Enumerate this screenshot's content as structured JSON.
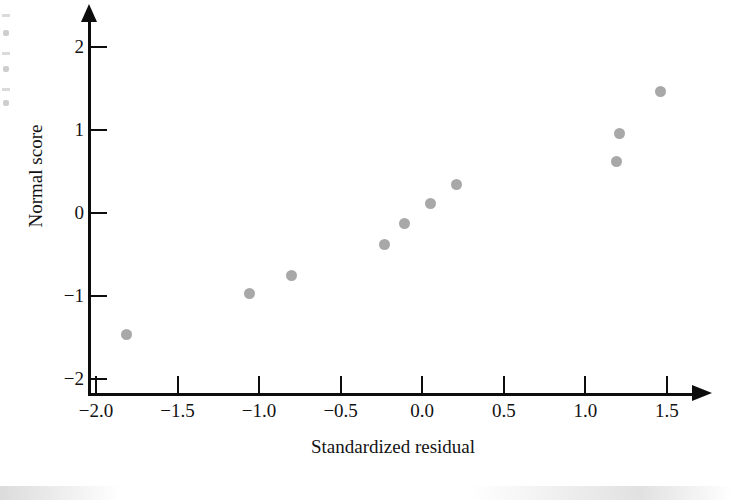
{
  "figure": {
    "background_color": "#ffffff",
    "point_color": "#a8a8a8",
    "axis_color": "#0d0d0d"
  },
  "chart_data": {
    "type": "scatter",
    "title": "",
    "xlabel": "Standardized residual",
    "ylabel": "Normal score",
    "xlim": [
      -2.1,
      1.72
    ],
    "ylim": [
      -2.25,
      2.2
    ],
    "grid": false,
    "legend": null,
    "x_ticks": [
      "-2.0",
      "-1.5",
      "-1.0",
      "-0.5",
      "0.0",
      "0.5",
      "1.0",
      "1.5"
    ],
    "x_tick_values": [
      -2.0,
      -1.5,
      -1.0,
      -0.5,
      0.0,
      0.5,
      1.0,
      1.5
    ],
    "y_ticks": [
      "2",
      "1",
      "0",
      "-1",
      "-2"
    ],
    "y_tick_values": [
      2,
      1,
      0,
      -1,
      -2
    ],
    "series": [
      {
        "name": "observations",
        "marker": "circle",
        "color": "#a8a8a8",
        "points": [
          {
            "x": -1.81,
            "y": -1.47
          },
          {
            "x": -1.06,
            "y": -0.97
          },
          {
            "x": -0.8,
            "y": -0.75
          },
          {
            "x": -0.23,
            "y": -0.38
          },
          {
            "x": -0.11,
            "y": -0.13
          },
          {
            "x": 0.05,
            "y": 0.11
          },
          {
            "x": 0.21,
            "y": 0.35
          },
          {
            "x": 1.19,
            "y": 0.62
          },
          {
            "x": 1.21,
            "y": 0.96
          },
          {
            "x": 1.46,
            "y": 1.47
          }
        ]
      }
    ]
  }
}
